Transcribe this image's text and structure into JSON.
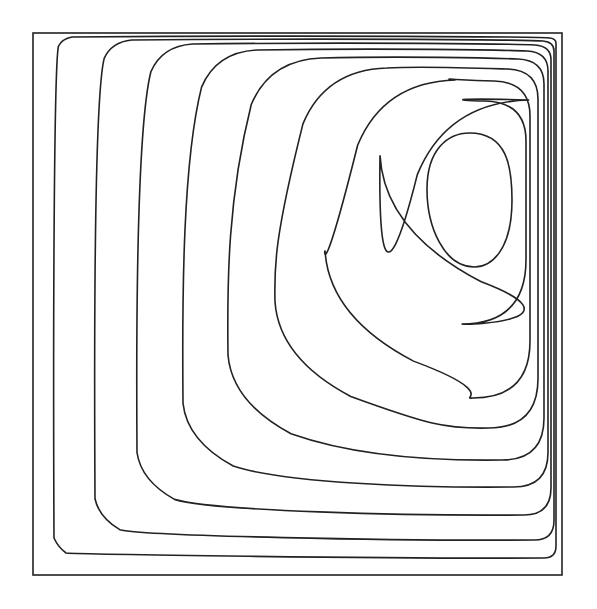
{
  "chart_data": {
    "type": "contour",
    "title": "",
    "xlabel": "",
    "ylabel": "",
    "grid": false,
    "legend": null,
    "frame": {
      "x0": 33,
      "y0": 33,
      "x1": 562,
      "y1": 575
    },
    "line_color": "#222222",
    "vortex_center": {
      "x": 470,
      "y": 200
    },
    "contours": [
      {
        "level": 1,
        "left": 54,
        "top": 37,
        "right": 556,
        "bottom": 558
      },
      {
        "level": 2,
        "left": 95,
        "top": 40,
        "right": 554,
        "bottom": 540
      },
      {
        "level": 3,
        "left": 137,
        "top": 44,
        "right": 551,
        "bottom": 515
      },
      {
        "level": 4,
        "left": 183,
        "top": 50,
        "right": 548,
        "bottom": 487
      },
      {
        "level": 5,
        "left": 228,
        "top": 58,
        "right": 544,
        "bottom": 460
      },
      {
        "level": 6,
        "left": 275,
        "top": 68,
        "right": 538,
        "bottom": 428
      },
      {
        "level": 7,
        "left": 325,
        "top": 80,
        "right": 530,
        "bottom": 398
      },
      {
        "level": 8,
        "left": 380,
        "top": 100,
        "right": 526,
        "bottom": 324
      },
      {
        "level": 9,
        "left": 427,
        "top": 133,
        "right": 512,
        "bottom": 267
      }
    ]
  }
}
